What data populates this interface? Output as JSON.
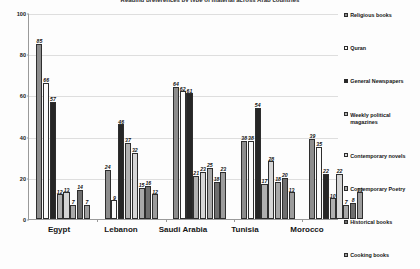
{
  "chart_data": {
    "type": "bar",
    "title": "Reading preferences by type of material across Arab countries",
    "xlabel": "",
    "ylabel": "",
    "ylim": [
      0,
      100
    ],
    "yticks": [
      0,
      20,
      40,
      60,
      80,
      100
    ],
    "grid": true,
    "legend_position": "right",
    "categories": [
      "Egypt",
      "Lebanon",
      "Saudi Arabia",
      "Tunisia",
      "Morocco"
    ],
    "series": [
      {
        "name": "Religious books",
        "values": [
          85,
          24,
          64,
          38,
          39
        ]
      },
      {
        "name": "Quran",
        "values": [
          66,
          9,
          62,
          38,
          35
        ]
      },
      {
        "name": "General Newspapers",
        "values": [
          57,
          46,
          61,
          54,
          22
        ]
      },
      {
        "name": "Weekly political magazines",
        "values": [
          12,
          37,
          21,
          17,
          10
        ]
      },
      {
        "name": "Contemporary novels",
        "values": [
          13,
          32,
          23,
          28,
          22
        ]
      },
      {
        "name": "Contemporary Poetry",
        "values": [
          7,
          15,
          25,
          18,
          7
        ]
      },
      {
        "name": "Historical books",
        "values": [
          14,
          16,
          18,
          20,
          8
        ]
      },
      {
        "name": "Cooking books",
        "values": [
          7,
          12,
          23,
          13,
          13
        ]
      }
    ]
  },
  "legend": {
    "items": [
      {
        "label": "Religious books"
      },
      {
        "label": "Quran"
      },
      {
        "label": "General Newspapers"
      },
      {
        "label": "Weekly political magazines"
      },
      {
        "label": "Contemporary novels"
      },
      {
        "label": "Contemporary Poetry"
      },
      {
        "label": "Historical books"
      },
      {
        "label": "Cooking books"
      }
    ]
  },
  "footer": {
    "mark": ""
  }
}
